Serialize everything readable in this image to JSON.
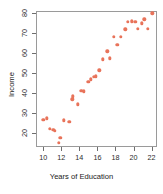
{
  "chart_data": {
    "type": "scatter",
    "title": "",
    "xlabel": "Years of Education",
    "ylabel": "Income",
    "xlim": [
      9.2,
      22.6
    ],
    "ylim": [
      13,
      81
    ],
    "grid": false,
    "legend": null,
    "point_color": "#e8735a",
    "xticks": [
      10,
      12,
      14,
      16,
      18,
      20,
      22
    ],
    "yticks": [
      20,
      30,
      40,
      50,
      60,
      70,
      80
    ],
    "xtick_labels": [
      "10",
      "12",
      "14",
      "16",
      "18",
      "20",
      "22"
    ],
    "ytick_labels": [
      "20",
      "30",
      "40",
      "50",
      "60",
      "70",
      "80"
    ],
    "x": [
      10.0,
      10.4,
      10.7,
      11.1,
      11.3,
      11.7,
      11.9,
      12.3,
      12.9,
      13.2,
      13.3,
      13.8,
      14.2,
      14.5,
      15.0,
      15.3,
      15.6,
      15.8,
      16.2,
      16.6,
      17.1,
      17.4,
      17.8,
      18.2,
      18.6,
      19.1,
      19.4,
      19.8,
      20.2,
      20.5,
      20.9,
      21.2,
      21.6,
      22.1
    ],
    "y": [
      26.6,
      27.3,
      22.1,
      21.6,
      21.1,
      15.2,
      17.6,
      26.3,
      25.7,
      36.9,
      38.4,
      34.3,
      41.2,
      40.9,
      45.7,
      46.9,
      48.2,
      48.3,
      51.3,
      56.9,
      60.9,
      57.3,
      68.1,
      64.2,
      68.2,
      71.9,
      75.5,
      75.8,
      75.7,
      72.2,
      74.9,
      76.8,
      72.2,
      79.9
    ],
    "n_points": 34,
    "point_shape": "circle",
    "axes_box": true
  }
}
